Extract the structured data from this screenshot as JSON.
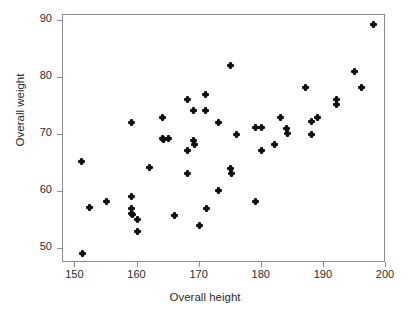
{
  "chart_data": {
    "type": "scatter",
    "title": "",
    "xlabel": "Overall height",
    "ylabel": "Overall weight",
    "xlim": [
      148,
      200
    ],
    "ylim": [
      47.5,
      91
    ],
    "xticks": [
      150,
      160,
      170,
      180,
      190,
      200
    ],
    "yticks": [
      50,
      60,
      70,
      80,
      90
    ],
    "xtick_labels": [
      "150",
      "160",
      "170",
      "180",
      "190",
      "200"
    ],
    "ytick_labels": [
      "50",
      "60",
      "70",
      "80",
      "90"
    ],
    "grid": false,
    "legend": null,
    "marker": "diamond",
    "marker_color": "#111111",
    "frame_color": "#8d8d8d",
    "background": "#ffffff",
    "n_points": 60,
    "points": [
      [
        151.0,
        65.3
      ],
      [
        151.2,
        49.2
      ],
      [
        152.2,
        57.2
      ],
      [
        155.0,
        58.3
      ],
      [
        159.0,
        72.2
      ],
      [
        159.0,
        59.1
      ],
      [
        159.1,
        57.0
      ],
      [
        159.0,
        56.2
      ],
      [
        159.2,
        56.0
      ],
      [
        160.0,
        55.2
      ],
      [
        160.0,
        53.0
      ],
      [
        162.0,
        64.3
      ],
      [
        164.0,
        73.0
      ],
      [
        164.0,
        69.4
      ],
      [
        164.1,
        69.2
      ],
      [
        165.0,
        69.3
      ],
      [
        166.0,
        55.9
      ],
      [
        168.0,
        76.1
      ],
      [
        168.0,
        67.2
      ],
      [
        168.1,
        63.2
      ],
      [
        169.0,
        74.3
      ],
      [
        169.0,
        69.0
      ],
      [
        169.1,
        68.3
      ],
      [
        170.0,
        54.1
      ],
      [
        171.0,
        77.1
      ],
      [
        171.0,
        74.2
      ],
      [
        171.1,
        57.1
      ],
      [
        173.0,
        72.2
      ],
      [
        173.0,
        60.2
      ],
      [
        175.0,
        82.2
      ],
      [
        175.0,
        64.1
      ],
      [
        175.1,
        63.2
      ],
      [
        176.0,
        70.1
      ],
      [
        179.0,
        71.2
      ],
      [
        179.0,
        58.3
      ],
      [
        180.0,
        71.2
      ],
      [
        180.0,
        67.2
      ],
      [
        182.0,
        68.3
      ],
      [
        183.0,
        73.0
      ],
      [
        184.0,
        71.1
      ],
      [
        184.1,
        70.2
      ],
      [
        187.0,
        78.2
      ],
      [
        188.0,
        72.3
      ],
      [
        188.0,
        70.1
      ],
      [
        189.0,
        73.0
      ],
      [
        192.0,
        76.1
      ],
      [
        192.1,
        75.3
      ],
      [
        195.0,
        81.1
      ],
      [
        196.0,
        78.2
      ],
      [
        198.0,
        89.4
      ]
    ]
  }
}
